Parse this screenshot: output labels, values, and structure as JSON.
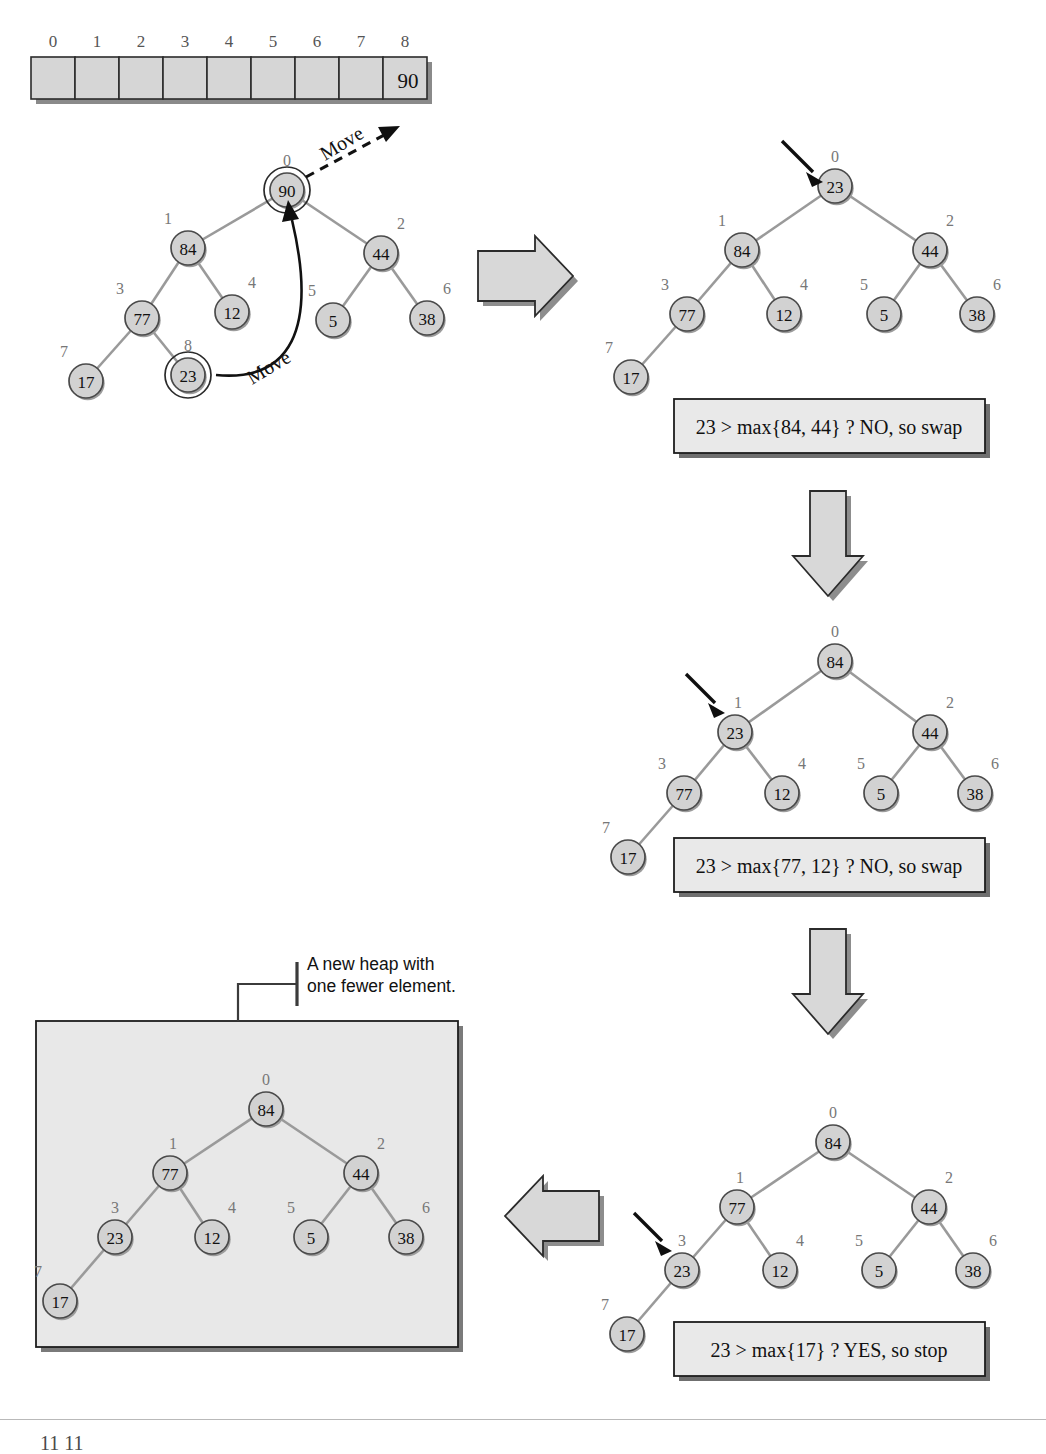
{
  "figure": {
    "kind": "heap-deletemax-diagram",
    "caption_partial": "11 11"
  },
  "array": {
    "name": "heap-array",
    "indices": [
      "0",
      "1",
      "2",
      "3",
      "4",
      "5",
      "6",
      "7",
      "8"
    ],
    "values": [
      "",
      "",
      "",
      "",
      "",
      "",
      "",
      "",
      "90"
    ]
  },
  "move_labels": {
    "to_array": "Move",
    "to_root": "Move"
  },
  "annotation": {
    "line1": "A new heap with",
    "line2": "one fewer element."
  },
  "panels": [
    {
      "id": "panel-start",
      "name": "tree-before-removal",
      "nodes": [
        {
          "index": "0",
          "value": "90",
          "ring": true
        },
        {
          "index": "1",
          "value": "84",
          "ring": false
        },
        {
          "index": "2",
          "value": "44",
          "ring": false
        },
        {
          "index": "3",
          "value": "77",
          "ring": false
        },
        {
          "index": "4",
          "value": "12",
          "ring": false
        },
        {
          "index": "5",
          "value": "5",
          "ring": false
        },
        {
          "index": "6",
          "value": "38",
          "ring": false
        },
        {
          "index": "7",
          "value": "17",
          "ring": false
        },
        {
          "index": "8",
          "value": "23",
          "ring": true
        }
      ],
      "caption": null
    },
    {
      "id": "panel-step1",
      "name": "tree-after-move-to-root",
      "nodes": [
        {
          "index": "0",
          "value": "23",
          "ring": false
        },
        {
          "index": "1",
          "value": "84",
          "ring": false
        },
        {
          "index": "2",
          "value": "44",
          "ring": false
        },
        {
          "index": "3",
          "value": "77",
          "ring": false
        },
        {
          "index": "4",
          "value": "12",
          "ring": false
        },
        {
          "index": "5",
          "value": "5",
          "ring": false
        },
        {
          "index": "6",
          "value": "38",
          "ring": false
        },
        {
          "index": "7",
          "value": "17",
          "ring": false
        }
      ],
      "pointer_index": "0",
      "caption": "23 > max{84, 44} ? NO, so swap"
    },
    {
      "id": "panel-step2",
      "name": "tree-after-first-swap",
      "nodes": [
        {
          "index": "0",
          "value": "84",
          "ring": false
        },
        {
          "index": "1",
          "value": "23",
          "ring": false
        },
        {
          "index": "2",
          "value": "44",
          "ring": false
        },
        {
          "index": "3",
          "value": "77",
          "ring": false
        },
        {
          "index": "4",
          "value": "12",
          "ring": false
        },
        {
          "index": "5",
          "value": "5",
          "ring": false
        },
        {
          "index": "6",
          "value": "38",
          "ring": false
        },
        {
          "index": "7",
          "value": "17",
          "ring": false
        }
      ],
      "pointer_index": "1",
      "caption": "23 > max{77, 12} ? NO, so swap"
    },
    {
      "id": "panel-step3",
      "name": "tree-after-second-swap",
      "nodes": [
        {
          "index": "0",
          "value": "84",
          "ring": false
        },
        {
          "index": "1",
          "value": "77",
          "ring": false
        },
        {
          "index": "2",
          "value": "44",
          "ring": false
        },
        {
          "index": "3",
          "value": "23",
          "ring": false
        },
        {
          "index": "4",
          "value": "12",
          "ring": false
        },
        {
          "index": "5",
          "value": "5",
          "ring": false
        },
        {
          "index": "6",
          "value": "38",
          "ring": false
        },
        {
          "index": "7",
          "value": "17",
          "ring": false
        }
      ],
      "pointer_index": "3",
      "caption": "23 > max{17} ? YES, so stop"
    },
    {
      "id": "panel-result",
      "name": "tree-final-heap",
      "nodes": [
        {
          "index": "0",
          "value": "84",
          "ring": false
        },
        {
          "index": "1",
          "value": "77",
          "ring": false
        },
        {
          "index": "2",
          "value": "44",
          "ring": false
        },
        {
          "index": "3",
          "value": "23",
          "ring": false
        },
        {
          "index": "4",
          "value": "12",
          "ring": false
        },
        {
          "index": "5",
          "value": "5",
          "ring": false
        },
        {
          "index": "6",
          "value": "38",
          "ring": false
        },
        {
          "index": "7",
          "value": "17",
          "ring": false
        }
      ],
      "caption": null
    }
  ],
  "flow_arrows": [
    {
      "name": "flow-arrow-right-top",
      "direction": "right"
    },
    {
      "name": "flow-arrow-down-upper",
      "direction": "down"
    },
    {
      "name": "flow-arrow-down-lower",
      "direction": "down"
    },
    {
      "name": "flow-arrow-left-bottom",
      "direction": "left"
    }
  ],
  "colors": {
    "node_fill": "#d2d2d2",
    "edge": "#9a9a9a",
    "box_fill": "#e9e9e9",
    "panel_fill": "#e8e8e8",
    "block_arrow": "#d8d8d8",
    "index_label": "#777777"
  }
}
